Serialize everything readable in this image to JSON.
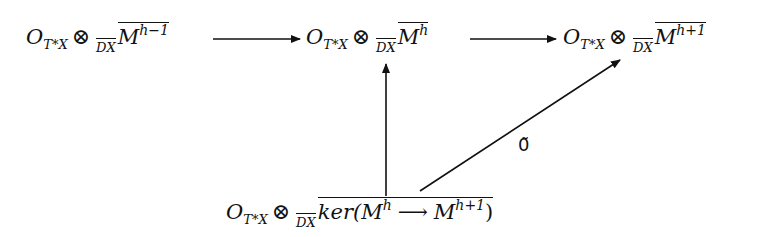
{
  "diagram": {
    "type": "commutative-diagram",
    "nodes": [
      {
        "id": "A",
        "sheaf": "O",
        "sheaf_sub": "T*X",
        "tensor": "⊗",
        "ring": "D",
        "ring_sub": "X",
        "module": "M",
        "module_sup": "h−1"
      },
      {
        "id": "B",
        "sheaf": "O",
        "sheaf_sub": "T*X",
        "tensor": "⊗",
        "ring": "D",
        "ring_sub": "X",
        "module": "M",
        "module_sup": "h"
      },
      {
        "id": "C",
        "sheaf": "O",
        "sheaf_sub": "T*X",
        "tensor": "⊗",
        "ring": "D",
        "ring_sub": "X",
        "module": "M",
        "module_sup": "h+1"
      },
      {
        "id": "D",
        "sheaf": "O",
        "sheaf_sub": "T*X",
        "tensor": "⊗",
        "ring": "D",
        "ring_sub": "X",
        "ker": "ker(",
        "module1": "M",
        "module1_sup": "h",
        "arrow": "⟶",
        "module2": "M",
        "module2_sup": "h+1",
        "close": ")"
      }
    ],
    "arrows": [
      {
        "from": "A",
        "to": "B",
        "label": ""
      },
      {
        "from": "B",
        "to": "C",
        "label": ""
      },
      {
        "from": "D",
        "to": "B",
        "label": ""
      },
      {
        "from": "D",
        "to": "C",
        "label": "0̃"
      }
    ]
  }
}
